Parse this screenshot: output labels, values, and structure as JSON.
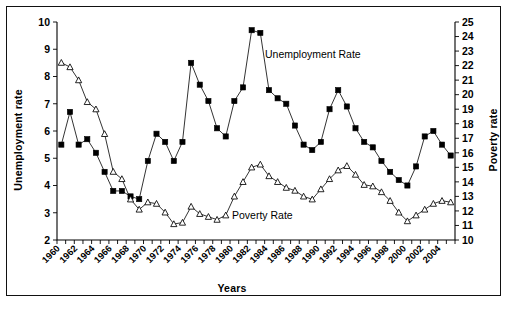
{
  "figure": {
    "border_color": "#111111",
    "background": "#ffffff"
  },
  "chart_data": {
    "type": "line",
    "title": "",
    "xlabel": "Years",
    "ylabel": "Unemployment rate",
    "y2label": "Poverty rate",
    "xlim": [
      1960,
      2005
    ],
    "ylim": [
      2,
      10
    ],
    "y2lim": [
      10,
      25
    ],
    "grid": false,
    "legend_position": "inline-annotation",
    "x_tick_labels": [
      "1960",
      "1962",
      "1964",
      "1966",
      "1968",
      "1970",
      "1972",
      "1974",
      "1976",
      "1978",
      "1980",
      "1982",
      "1984",
      "1986",
      "1988",
      "1990",
      "1992",
      "1994",
      "1996",
      "1998",
      "2000",
      "2002",
      "2004"
    ],
    "y_tick_labels": [
      "2",
      "3",
      "4",
      "5",
      "6",
      "7",
      "8",
      "9",
      "10"
    ],
    "y2_tick_labels": [
      "10",
      "11",
      "12",
      "13",
      "14",
      "15",
      "16",
      "17",
      "18",
      "19",
      "20",
      "21",
      "22",
      "23",
      "24",
      "25"
    ],
    "x": [
      1960,
      1961,
      1962,
      1963,
      1964,
      1965,
      1966,
      1967,
      1968,
      1969,
      1970,
      1971,
      1972,
      1973,
      1974,
      1975,
      1976,
      1977,
      1978,
      1979,
      1980,
      1981,
      1982,
      1983,
      1984,
      1985,
      1986,
      1987,
      1988,
      1989,
      1990,
      1991,
      1992,
      1993,
      1994,
      1995,
      1996,
      1997,
      1998,
      1999,
      2000,
      2001,
      2002,
      2003,
      2004,
      2005
    ],
    "series": [
      {
        "name": "Unemployment Rate",
        "marker": "filled-square",
        "axis": "left",
        "label_annotation": "Unemployment Rate",
        "values": [
          5.5,
          6.7,
          5.5,
          5.7,
          5.2,
          4.5,
          3.8,
          3.8,
          3.6,
          3.5,
          4.9,
          5.9,
          5.6,
          4.9,
          5.6,
          8.5,
          7.7,
          7.1,
          6.1,
          5.8,
          7.1,
          7.6,
          9.7,
          9.6,
          7.5,
          7.2,
          7.0,
          6.2,
          5.5,
          5.3,
          5.6,
          6.8,
          7.5,
          6.9,
          6.1,
          5.6,
          5.4,
          4.9,
          4.5,
          4.2,
          4.0,
          4.7,
          5.8,
          6.0,
          5.5,
          5.1
        ]
      },
      {
        "name": "Poverty Rate",
        "marker": "open-triangle",
        "axis": "right",
        "label_annotation": "Poverty Rate",
        "values": [
          22.2,
          21.9,
          21.0,
          19.5,
          19.0,
          17.3,
          14.7,
          14.2,
          12.8,
          12.1,
          12.6,
          12.5,
          11.9,
          11.1,
          11.2,
          12.3,
          11.8,
          11.6,
          11.4,
          11.7,
          13.0,
          14.0,
          15.0,
          15.2,
          14.4,
          14.0,
          13.6,
          13.4,
          13.0,
          12.8,
          13.5,
          14.2,
          14.8,
          15.1,
          14.5,
          13.8,
          13.7,
          13.3,
          12.7,
          11.9,
          11.3,
          11.7,
          12.1,
          12.5,
          12.7,
          12.6
        ]
      }
    ]
  }
}
